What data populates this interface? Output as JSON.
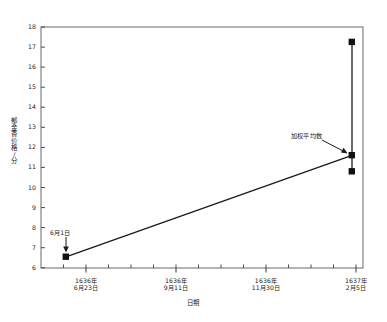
{
  "chart_data": {
    "type": "line",
    "title": "",
    "subtitle": "",
    "xlabel": "日期",
    "ylabel": "郁金香价格/分",
    "ylim": [
      6,
      18
    ],
    "ytick_values": [
      6,
      7,
      8,
      9,
      10,
      11,
      12,
      13,
      14,
      15,
      16,
      17,
      18
    ],
    "ytick_labels": [
      "6",
      "7",
      "8",
      "9",
      "10",
      "11",
      "12",
      "13",
      "14",
      "15",
      "16",
      "17",
      "18"
    ],
    "xtick_labels": [
      {
        "line1": "1636年",
        "line2": "6月23日"
      },
      {
        "line1": "1636年",
        "line2": "9月11日"
      },
      {
        "line1": "1636年",
        "line2": "11月30日"
      },
      {
        "line1": "1637年",
        "line2": "2月5日"
      }
    ],
    "grid": false,
    "legend": "none",
    "series": [
      {
        "name": "郁金香价格",
        "points": [
          {
            "x_label": "6月1日",
            "y": 6.6
          },
          {
            "x_label": "1637年2月5日",
            "y": 11.6
          }
        ]
      },
      {
        "name": "1637年2月5日价格区间",
        "points": [
          {
            "x_label": "1637年2月5日",
            "y": 17.25
          },
          {
            "x_label": "1637年2月5日",
            "y": 11.6
          },
          {
            "x_label": "1637年2月5日",
            "y": 10.8
          }
        ]
      }
    ],
    "annotations": [
      {
        "text": "6月1日",
        "target_y": 6.6,
        "arrow": "down"
      },
      {
        "text": "加权平均数",
        "target_y": 11.6,
        "arrow": "down-right"
      }
    ],
    "colors": {
      "line": "#1a1a1a",
      "marker": "#111111",
      "axis": "#555555",
      "background": "#ffffff"
    }
  }
}
